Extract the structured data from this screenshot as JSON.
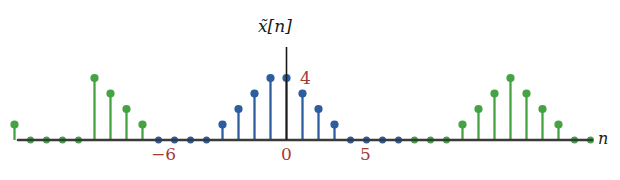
{
  "figure": {
    "title": "x̃[n]",
    "axis_label_x": "n",
    "peak_label": "4",
    "tick_labels": [
      {
        "text": "−6",
        "n": -6
      },
      {
        "text": "0",
        "n": 0
      },
      {
        "text": "5",
        "n": 5
      }
    ],
    "colors": {
      "primary_blue": "#2d5d9e",
      "secondary_green": "#45a344",
      "axis": "#3a3a3a",
      "label_red": "#a33a34",
      "background": "#ffffff"
    }
  },
  "chart_data": {
    "type": "stem",
    "title": "x̃[n]",
    "xlabel": "n",
    "ylabel": "",
    "period": 16,
    "xlim": [
      -18,
      19
    ],
    "ylim": [
      0,
      5.6
    ],
    "grid": false,
    "legend": null,
    "annotations": [
      {
        "text": "4",
        "n": 0,
        "value": 4,
        "color": "#a33a34"
      },
      {
        "text": "−6",
        "n": -6,
        "value": 0,
        "color": "#a33a34"
      },
      {
        "text": "0",
        "n": 0,
        "value": 0,
        "color": "#a33a34"
      },
      {
        "text": "5",
        "n": 5,
        "value": 0,
        "color": "#a33a34"
      }
    ],
    "series": [
      {
        "name": "center-period",
        "color": "#2d5d9e",
        "x": [
          -8,
          -7,
          -6,
          -5,
          -4,
          -3,
          -2,
          -1,
          0,
          1,
          2,
          3,
          4,
          5,
          6,
          7
        ],
        "values": [
          0,
          0,
          0,
          0,
          1,
          2,
          3,
          4,
          4,
          3,
          2,
          1,
          0,
          0,
          0,
          0
        ]
      },
      {
        "name": "left-period",
        "color": "#45a344",
        "x": [
          -18,
          -17,
          -16,
          -15,
          -14,
          -13,
          -12,
          -11,
          -10,
          -9
        ],
        "values": [
          2,
          1,
          0,
          0,
          0,
          0,
          4,
          3,
          2,
          1
        ]
      },
      {
        "name": "right-period",
        "color": "#45a344",
        "x": [
          8,
          9,
          10,
          11,
          12,
          13,
          14,
          15,
          16,
          17,
          18,
          19
        ],
        "values": [
          0,
          0,
          0,
          1,
          2,
          3,
          4,
          3,
          2,
          1,
          0,
          0
        ]
      }
    ]
  }
}
